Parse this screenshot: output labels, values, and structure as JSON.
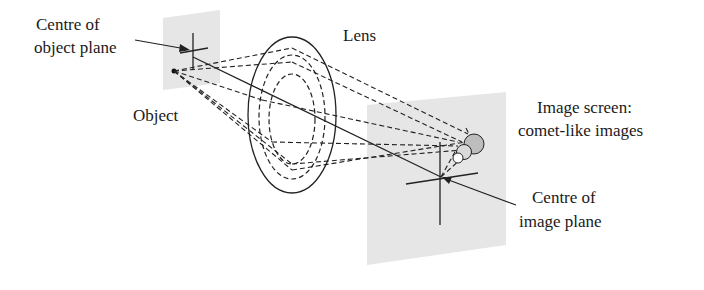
{
  "labels": {
    "centre_object_line1": "Centre of",
    "centre_object_line2": "object plane",
    "object": "Object",
    "lens": "Lens",
    "image_screen_line1": "Image screen:",
    "image_screen_line2": "comet-like images",
    "centre_image_line1": "Centre of",
    "centre_image_line2": "image plane"
  },
  "colors": {
    "plane_fill": "#e6e6e6",
    "line": "#222222",
    "comet_large": "#bdbdbd",
    "comet_mid": "#d9d9d9",
    "comet_small": "#ffffff"
  }
}
